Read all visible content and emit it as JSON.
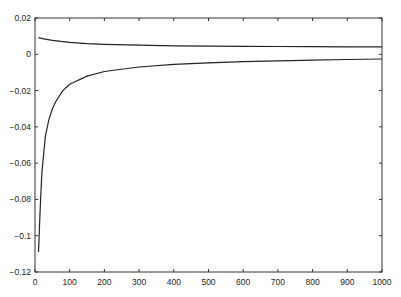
{
  "chart_data": {
    "type": "line",
    "title": "",
    "xlabel": "",
    "ylabel": "",
    "xlim": [
      0,
      1000
    ],
    "ylim": [
      -0.12,
      0.02
    ],
    "grid": false,
    "legend": null,
    "x_ticks": [
      "0",
      "100",
      "200",
      "300",
      "400",
      "500",
      "600",
      "700",
      "800",
      "900",
      "1000"
    ],
    "y_ticks": [
      "0.02",
      "0",
      "-0.02",
      "-0.04",
      "-0.06",
      "-0.08",
      "-0.1",
      "-0.12"
    ],
    "series": [
      {
        "name": "upper",
        "x": [
          10,
          25,
          50,
          75,
          100,
          150,
          200,
          300,
          400,
          500,
          600,
          700,
          800,
          900,
          1000
        ],
        "y": [
          0.0092,
          0.0085,
          0.0077,
          0.0071,
          0.0066,
          0.0059,
          0.0055,
          0.005,
          0.0047,
          0.0045,
          0.0044,
          0.0043,
          0.0042,
          0.0041,
          0.0041
        ]
      },
      {
        "name": "lower",
        "x": [
          10,
          15,
          20,
          30,
          40,
          50,
          60,
          80,
          100,
          150,
          200,
          300,
          400,
          500,
          600,
          700,
          800,
          900,
          1000
        ],
        "y": [
          -0.109,
          -0.085,
          -0.065,
          -0.045,
          -0.036,
          -0.03,
          -0.026,
          -0.02,
          -0.0165,
          -0.012,
          -0.0095,
          -0.007,
          -0.0055,
          -0.0047,
          -0.0041,
          -0.0036,
          -0.0032,
          -0.0029,
          -0.0026
        ]
      }
    ]
  }
}
